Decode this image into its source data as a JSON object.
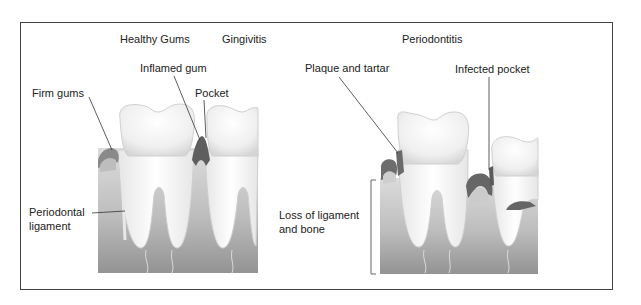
{
  "diagram": {
    "section_titles": {
      "healthy": "Healthy Gums",
      "gingivitis": "Gingivitis",
      "periodontitis": "Periodontitis"
    },
    "labels": {
      "firm_gums": "Firm gums",
      "inflamed_gum": "Inflamed gum",
      "pocket": "Pocket",
      "periodontal_ligament_1": "Periodontal",
      "periodontal_ligament_2": "ligament",
      "plaque_and_tartar": "Plaque and tartar",
      "infected_pocket": "Infected pocket",
      "loss_1": "Loss of ligament",
      "loss_2": "and bone"
    },
    "colors": {
      "frame": "#444444",
      "tooth": "#f4f4f4",
      "bone_top": "#d8d8d8",
      "bone_bottom": "#9a9a9a",
      "gum_dark": "#7a7a7a",
      "gum_light": "#c8c8c8"
    }
  }
}
